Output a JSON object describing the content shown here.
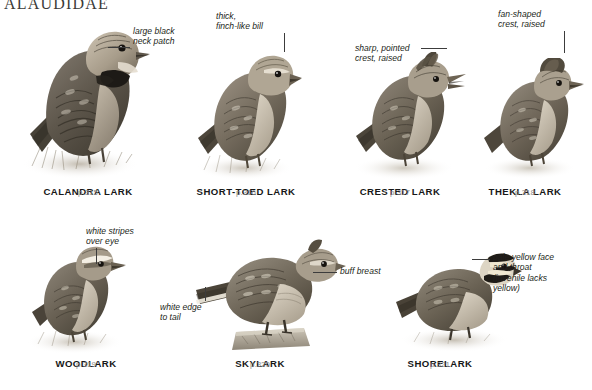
{
  "header": {
    "family": "ALAUDIDAE"
  },
  "plate": {
    "rows": [
      {
        "species": [
          {
            "name": "CALANDRA LARK",
            "page": "p.315",
            "annotation": "large black\nneck patch"
          },
          {
            "name": "SHORT-TOED LARK",
            "page": "p.316",
            "annotation": "thick,\nfinch-like bill"
          },
          {
            "name": "CRESTED LARK",
            "page": "p.317",
            "annotation": "sharp, pointed\ncrest, raised"
          },
          {
            "name": "THEKLA LARK",
            "page": "p.318",
            "annotation": "fan-shaped\ncrest, raised"
          }
        ]
      },
      {
        "species": [
          {
            "name": "WOODLARK",
            "page": "p.319",
            "annotation": "white stripes\nover eye",
            "annotation2": "white edge\nto tail"
          },
          {
            "name": "SKYLARK",
            "page": "p.320",
            "annotation": "buff breast"
          },
          {
            "name": "SHORELARK",
            "page": "p.321",
            "annotation": "pale yellow face\nand throat\n(juvenile lacks\nyellow)"
          }
        ]
      }
    ]
  },
  "colors": {
    "page_background": "#ffffff",
    "header_text": "#3a3a38",
    "species_name": "#171717",
    "page_reference": "#8c8c8c",
    "annotation_text": "#231f20",
    "leader_line": "#3c3c3c",
    "plumage_dark": "#3b372f",
    "plumage_mid": "#6d655a",
    "plumage_light": "#b6ac9c",
    "plumage_pale": "#ddd5c6"
  }
}
